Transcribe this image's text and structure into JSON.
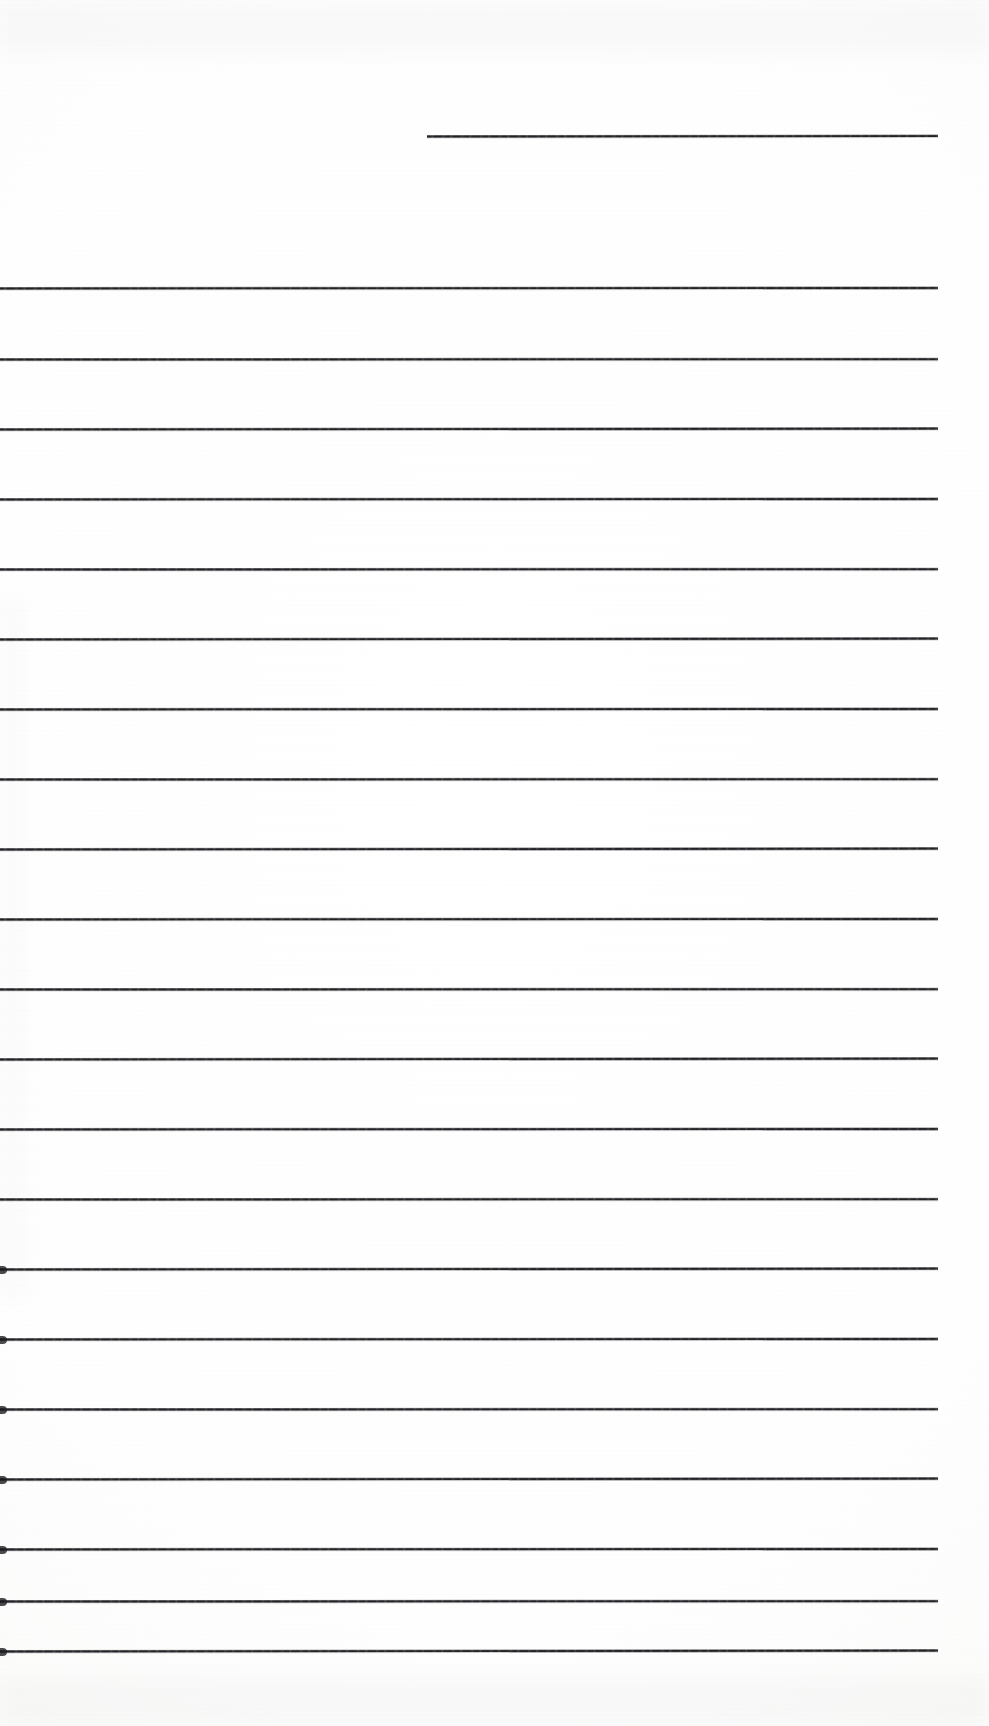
{
  "document": {
    "kind": "scanned-lined-paper",
    "title": "Blank Ruled Notebook Page",
    "page_width": 989,
    "page_height": 1726,
    "background_color": "#fefefe",
    "ink_color": "#1a1a1e",
    "content_text": "",
    "note": "Blank ruled page: no handwriting, no printed text, no page number"
  },
  "ruling": {
    "line_count": 22,
    "line_thickness": 3,
    "line_spacing": 70,
    "full_width_start_x": 0,
    "full_width_end_x": 938,
    "first_line_is_short": true,
    "lines": [
      {
        "id": "rule-01",
        "y": 135,
        "x1": 427,
        "x2": 938,
        "nub": false
      },
      {
        "id": "rule-02",
        "y": 287,
        "x1": 0,
        "x2": 938,
        "nub": false
      },
      {
        "id": "rule-03",
        "y": 358,
        "x1": 0,
        "x2": 938,
        "nub": false
      },
      {
        "id": "rule-04",
        "y": 428,
        "x1": 0,
        "x2": 938,
        "nub": false
      },
      {
        "id": "rule-05",
        "y": 498,
        "x1": 0,
        "x2": 938,
        "nub": false
      },
      {
        "id": "rule-06",
        "y": 568,
        "x1": 0,
        "x2": 938,
        "nub": false
      },
      {
        "id": "rule-07",
        "y": 638,
        "x1": 0,
        "x2": 938,
        "nub": false
      },
      {
        "id": "rule-08",
        "y": 708,
        "x1": 0,
        "x2": 938,
        "nub": false
      },
      {
        "id": "rule-09",
        "y": 778,
        "x1": 0,
        "x2": 938,
        "nub": false
      },
      {
        "id": "rule-10",
        "y": 848,
        "x1": 0,
        "x2": 938,
        "nub": false
      },
      {
        "id": "rule-11",
        "y": 918,
        "x1": 0,
        "x2": 938,
        "nub": false
      },
      {
        "id": "rule-12",
        "y": 988,
        "x1": 0,
        "x2": 938,
        "nub": false
      },
      {
        "id": "rule-13",
        "y": 1058,
        "x1": 0,
        "x2": 938,
        "nub": false
      },
      {
        "id": "rule-14",
        "y": 1128,
        "x1": 0,
        "x2": 938,
        "nub": false
      },
      {
        "id": "rule-15",
        "y": 1198,
        "x1": 0,
        "x2": 938,
        "nub": false
      },
      {
        "id": "rule-16",
        "y": 1268,
        "x1": 0,
        "x2": 938,
        "nub": true
      },
      {
        "id": "rule-17",
        "y": 1338,
        "x1": 0,
        "x2": 938,
        "nub": true
      },
      {
        "id": "rule-18",
        "y": 1408,
        "x1": 0,
        "x2": 938,
        "nub": true
      },
      {
        "id": "rule-19",
        "y": 1478,
        "x1": 0,
        "x2": 938,
        "nub": true
      },
      {
        "id": "rule-20",
        "y": 1548,
        "x1": 0,
        "x2": 938,
        "nub": true
      },
      {
        "id": "rule-21",
        "y": 1600,
        "x1": 0,
        "x2": 938,
        "nub": true
      },
      {
        "id": "rule-22",
        "y": 1650,
        "x1": 0,
        "x2": 938,
        "nub": true
      }
    ]
  }
}
